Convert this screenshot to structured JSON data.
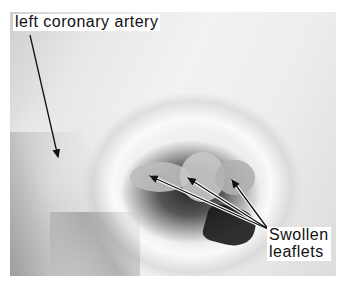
{
  "image": {
    "description": "Grayscale photograph of an opened heart showing aortic valve with swollen leaflets",
    "colors": {
      "background": "#ffffff",
      "label_bg": "#ffffff",
      "text": "#111111",
      "arrow": "#111111"
    }
  },
  "labels": {
    "artery": "left coronary artery",
    "leaflets_line1": "Swollen",
    "leaflets_line2": "leaflets"
  },
  "arrows": [
    {
      "name": "artery-arrow",
      "from": [
        30,
        35
      ],
      "to": [
        58,
        157
      ]
    },
    {
      "name": "leaflet-arrow-1",
      "from": [
        268,
        229
      ],
      "to": [
        150,
        176
      ]
    },
    {
      "name": "leaflet-arrow-2",
      "from": [
        268,
        229
      ],
      "to": [
        188,
        178
      ]
    },
    {
      "name": "leaflet-arrow-3",
      "from": [
        268,
        229
      ],
      "to": [
        232,
        180
      ]
    }
  ]
}
